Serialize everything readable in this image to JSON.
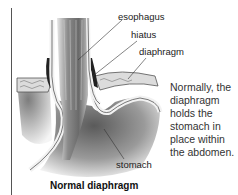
{
  "figure": {
    "title": "Normal diaphragm",
    "labels": [
      {
        "id": "esophagus",
        "text": "esophagus"
      },
      {
        "id": "hiatus",
        "text": "hiatus"
      },
      {
        "id": "diaphragm",
        "text": "diaphragm"
      },
      {
        "id": "stomach",
        "text": "stomach"
      }
    ],
    "description": "Normally, the diaphragm holds the stomach in place within the abdomen.",
    "description_lines": [
      "Normally, the",
      "diaphragm",
      "holds the",
      "stomach in",
      "place within",
      "the abdomen."
    ]
  }
}
